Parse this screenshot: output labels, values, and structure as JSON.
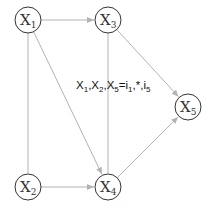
{
  "diagram": {
    "type": "directed-graph",
    "edge_color": "#b3b3b3",
    "node_stroke_color": "#333333",
    "nodes": [
      {
        "id": "X1",
        "base": "X",
        "sub": "1"
      },
      {
        "id": "X2",
        "base": "X",
        "sub": "2"
      },
      {
        "id": "X3",
        "base": "X",
        "sub": "3"
      },
      {
        "id": "X4",
        "base": "X",
        "sub": "4"
      },
      {
        "id": "X5",
        "base": "X",
        "sub": "5"
      }
    ],
    "edges": [
      {
        "from": "X1",
        "to": "X3",
        "directed": true
      },
      {
        "from": "X1",
        "to": "X2",
        "directed": false
      },
      {
        "from": "X1",
        "to": "X4",
        "directed": true
      },
      {
        "from": "X3",
        "to": "X4",
        "directed": false
      },
      {
        "from": "X3",
        "to": "X5",
        "directed": true
      },
      {
        "from": "X2",
        "to": "X4",
        "directed": true
      },
      {
        "from": "X4",
        "to": "X5",
        "directed": true
      }
    ],
    "annotation": {
      "parts": [
        {
          "t": "X",
          "sub": "1"
        },
        {
          "t": ",X",
          "sub": "2"
        },
        {
          "t": ",X",
          "sub": "5"
        },
        {
          "t": "=i",
          "sub": "1"
        },
        {
          "t": ",*,i",
          "sub": "5"
        }
      ],
      "plain": "X1,X2,X5=i1,*,i5"
    }
  }
}
